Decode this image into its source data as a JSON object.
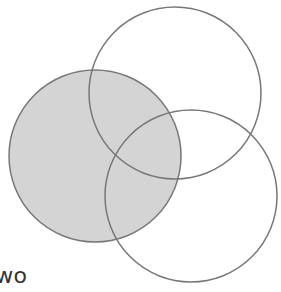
{
  "diagram": {
    "type": "venn",
    "circles": [
      {
        "id": "left",
        "cx": 95,
        "cy": 156,
        "r": 86,
        "fill": "#d4d4d4",
        "shaded": true
      },
      {
        "id": "top",
        "cx": 175,
        "cy": 93,
        "r": 86,
        "fill": "none",
        "shaded": false
      },
      {
        "id": "bottom",
        "cx": 191,
        "cy": 196,
        "r": 86,
        "fill": "none",
        "shaded": false
      }
    ],
    "stroke": "#777777",
    "label": "two"
  }
}
